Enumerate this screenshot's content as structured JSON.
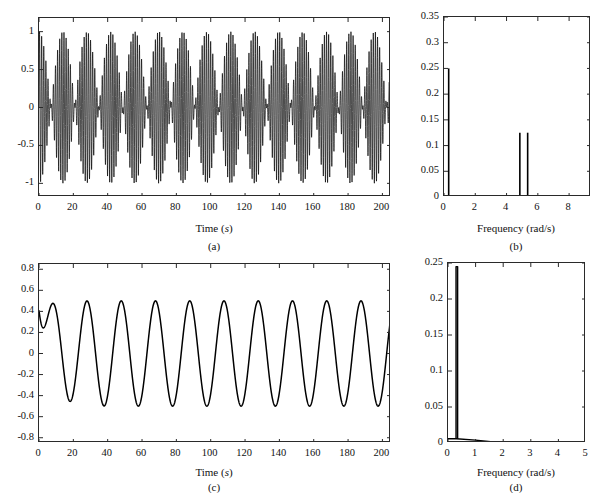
{
  "figure": {
    "background": "#ffffff",
    "line_color": "#000000",
    "axis_color": "#2a2a2a"
  },
  "chart_data": [
    {
      "id": "a",
      "type": "line",
      "title": "",
      "panel_label": "(a)",
      "xlabel": "Time (s)",
      "xlabel_unit_italic": "s",
      "ylabel": "",
      "xlim": [
        0,
        205
      ],
      "ylim": [
        -1.18,
        1.18
      ],
      "xticks": [
        0,
        20,
        40,
        60,
        80,
        100,
        120,
        140,
        160,
        180,
        200
      ],
      "xticklabels": [
        "0",
        "20",
        "40",
        "60",
        "80",
        "100",
        "120",
        "140",
        "160",
        "180",
        "200"
      ],
      "yticks": [
        -1,
        -0.5,
        0,
        0.5,
        1
      ],
      "yticklabels": [
        "-1",
        "-0.5",
        "0",
        "0.5",
        "1"
      ],
      "grid": false,
      "description": "Beating signal: sum of two close sinusoids producing amplitude-modulated packets with beat period of about 20 s",
      "model": {
        "form": "0.5*sin(w1*t) + 0.5*sin(w2*t)",
        "w1": 4.85,
        "w2": 5.3,
        "amplitude": 1.0,
        "beat_period_s": 20,
        "carrier_period_s": 1.24,
        "samples": 4000
      }
    },
    {
      "id": "b",
      "type": "line",
      "title": "",
      "panel_label": "(b)",
      "xlabel": "Frequency (rad/s)",
      "ylabel": "",
      "xlim": [
        0,
        9.4
      ],
      "ylim": [
        0,
        0.35
      ],
      "xticks": [
        0,
        2,
        4,
        6,
        8
      ],
      "xticklabels": [
        "0",
        "2",
        "4",
        "6",
        "8"
      ],
      "yticks": [
        0,
        0.05,
        0.1,
        0.15,
        0.2,
        0.25,
        0.3,
        0.35
      ],
      "yticklabels": [
        "0",
        "0.05",
        "0.1",
        "0.15",
        "0.2",
        "0.25",
        "0.3",
        "0.35"
      ],
      "grid": false,
      "description": "Amplitude spectrum of signal (a): a low frequency line plus two closely spaced carrier lines",
      "peaks": [
        {
          "frequency": 0.3,
          "amplitude": 0.25
        },
        {
          "frequency": 4.85,
          "amplitude": 0.125
        },
        {
          "frequency": 5.35,
          "amplitude": 0.125
        }
      ]
    },
    {
      "id": "c",
      "type": "line",
      "title": "",
      "panel_label": "(c)",
      "xlabel": "Time (s)",
      "xlabel_unit_italic": "s",
      "ylabel": "",
      "xlim": [
        0,
        205
      ],
      "ylim": [
        -0.85,
        0.85
      ],
      "xticks": [
        0,
        20,
        40,
        60,
        80,
        100,
        120,
        140,
        160,
        180,
        200
      ],
      "xticklabels": [
        "0",
        "20",
        "40",
        "60",
        "80",
        "100",
        "120",
        "140",
        "160",
        "180",
        "200"
      ],
      "yticks": [
        -0.8,
        -0.6,
        -0.4,
        -0.2,
        0,
        0.2,
        0.4,
        0.6,
        0.8
      ],
      "yticklabels": [
        "-0.8",
        "-0.6",
        "-0.4",
        "-0.2",
        "0",
        "0.2",
        "0.4",
        "0.6",
        "0.8"
      ],
      "grid": false,
      "description": "Steady sinusoid of amplitude 0.5 and period about 20 s, starting from zero with a short transient to 0.37 near t = 5 s",
      "model": {
        "form": "0.5*sin(w*t + phi) with initial transient",
        "w": 0.315,
        "amplitude": 0.5,
        "period_s": 20,
        "transient_peak": 0.37,
        "transient_peak_time_s": 5,
        "start_value": 0.0,
        "end_value": 0.33,
        "samples": 1600
      }
    },
    {
      "id": "d",
      "type": "line",
      "title": "",
      "panel_label": "(d)",
      "xlabel": "Frequency (rad/s)",
      "ylabel": "",
      "xlim": [
        0,
        5
      ],
      "ylim": [
        0,
        0.25
      ],
      "xticks": [
        0,
        1,
        2,
        3,
        4,
        5
      ],
      "xticklabels": [
        "0",
        "1",
        "2",
        "3",
        "4",
        "5"
      ],
      "yticks": [
        0,
        0.05,
        0.1,
        0.15,
        0.2,
        0.25
      ],
      "yticklabels": [
        "0",
        "0.05",
        "0.1",
        "0.15",
        "0.2",
        "0.25"
      ],
      "grid": false,
      "description": "Amplitude spectrum of signal (c): one sharp peak near 0.32 rad/s over a small baseline decaying to zero near 2 rad/s",
      "peaks": [
        {
          "frequency": 0.32,
          "amplitude": 0.245
        }
      ],
      "baseline": [
        {
          "frequency": 0.0,
          "amplitude": 0.006
        },
        {
          "frequency": 0.3,
          "amplitude": 0.006
        },
        {
          "frequency": 1.0,
          "amplitude": 0.004
        },
        {
          "frequency": 2.0,
          "amplitude": 0.0
        },
        {
          "frequency": 5.0,
          "amplitude": 0.0
        }
      ]
    }
  ]
}
